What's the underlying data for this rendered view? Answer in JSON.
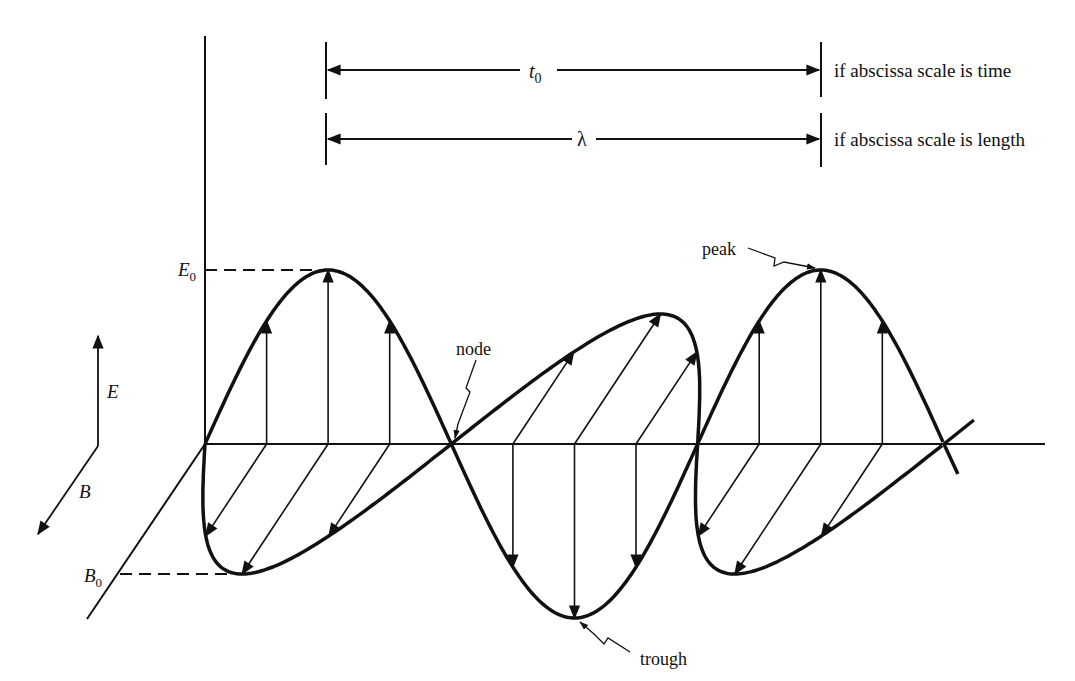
{
  "diagram": {
    "dimension_labels": {
      "period_symbol": "t",
      "period_subscript": "0",
      "period_note": "if abscissa scale is time",
      "wavelength_symbol": "λ",
      "wavelength_note": "if abscissa scale is length"
    },
    "axis_labels": {
      "e_amplitude": "E",
      "e_amplitude_subscript": "0",
      "b_amplitude": "B",
      "b_amplitude_subscript": "0"
    },
    "legend": {
      "e_label": "E",
      "b_label": "B"
    },
    "annotations": {
      "node": "node",
      "peak": "peak",
      "trough": "trough"
    },
    "colors": {
      "ink": "#111111",
      "background": "#ffffff"
    }
  }
}
